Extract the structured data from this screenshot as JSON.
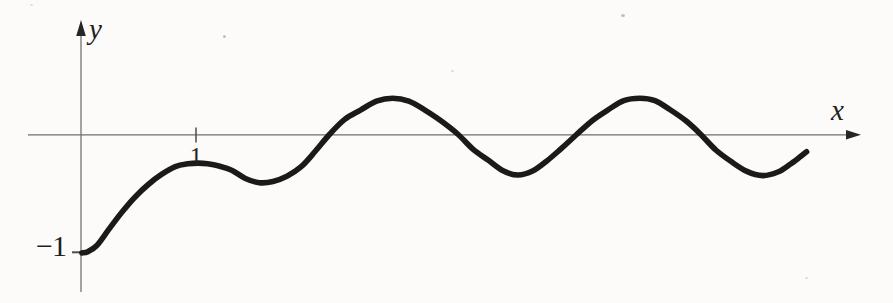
{
  "figure": {
    "width_px": 893,
    "height_px": 303,
    "background": "#fcfbf9",
    "axis_color": "#6e6e6e",
    "tick_color": "#4d4d4d",
    "arrow_color": "#262626",
    "curve_color": "#1a1a1a",
    "text_color": "#1f1f1f",
    "labels": {
      "x_axis": "x",
      "y_axis": "y",
      "x_tick_1": "1",
      "y_tick_neg1": "−1"
    }
  },
  "chart_data": {
    "type": "line",
    "title": "",
    "xlabel": "x",
    "ylabel": "y",
    "grid": false,
    "legend": "none",
    "axes": {
      "x_range_shown": [
        -0.46,
        6.78
      ],
      "y_range_shown": [
        -1.33,
        0.96
      ]
    },
    "x_ticks": [
      {
        "value": 1,
        "label": "1"
      }
    ],
    "y_ticks": [
      {
        "value": -1,
        "label": "−1"
      }
    ],
    "series": [
      {
        "name": "wave-curve",
        "description": "thick smooth curve starting flat at (0,-1), small local max near (1,-0.24), local min near (1.55,-0.41), then oscillating about the x-axis with peaks ~+0.30 at x=2.71 and x=4.86 and troughs ~-0.34 at x=3.80 and x=5.93, ending near (6.31,-0.15)",
        "points": [
          [
            0.008,
            -0.995
          ],
          [
            0.06,
            -0.985
          ],
          [
            0.14,
            -0.93
          ],
          [
            0.24,
            -0.8
          ],
          [
            0.35,
            -0.66
          ],
          [
            0.47,
            -0.525
          ],
          [
            0.585,
            -0.42
          ],
          [
            0.7,
            -0.335
          ],
          [
            0.82,
            -0.27
          ],
          [
            0.93,
            -0.246
          ],
          [
            1.02,
            -0.24
          ],
          [
            1.1,
            -0.246
          ],
          [
            1.2,
            -0.265
          ],
          [
            1.31,
            -0.3
          ],
          [
            1.43,
            -0.37
          ],
          [
            1.55,
            -0.405
          ],
          [
            1.67,
            -0.395
          ],
          [
            1.79,
            -0.35
          ],
          [
            1.91,
            -0.275
          ],
          [
            2.03,
            -0.15
          ],
          [
            2.16,
            0.0
          ],
          [
            2.29,
            0.125
          ],
          [
            2.43,
            0.205
          ],
          [
            2.57,
            0.28
          ],
          [
            2.71,
            0.305
          ],
          [
            2.85,
            0.28
          ],
          [
            2.99,
            0.205
          ],
          [
            3.13,
            0.115
          ],
          [
            3.28,
            0.0
          ],
          [
            3.41,
            -0.125
          ],
          [
            3.54,
            -0.215
          ],
          [
            3.67,
            -0.305
          ],
          [
            3.8,
            -0.34
          ],
          [
            3.93,
            -0.305
          ],
          [
            4.06,
            -0.215
          ],
          [
            4.18,
            -0.115
          ],
          [
            4.31,
            0.0
          ],
          [
            4.45,
            0.12
          ],
          [
            4.58,
            0.205
          ],
          [
            4.72,
            0.285
          ],
          [
            4.86,
            0.305
          ],
          [
            4.99,
            0.285
          ],
          [
            5.12,
            0.21
          ],
          [
            5.26,
            0.115
          ],
          [
            5.39,
            0.0
          ],
          [
            5.52,
            -0.13
          ],
          [
            5.65,
            -0.225
          ],
          [
            5.79,
            -0.31
          ],
          [
            5.93,
            -0.345
          ],
          [
            6.06,
            -0.315
          ],
          [
            6.16,
            -0.255
          ],
          [
            6.25,
            -0.19
          ],
          [
            6.31,
            -0.145
          ]
        ]
      }
    ],
    "layout_px": {
      "origin": {
        "x": 81,
        "y": 134.5
      },
      "unit_px": {
        "x": 115,
        "y": 119
      },
      "x_axis": {
        "x1": 28,
        "x2": 848,
        "arrow_tip_x": 861,
        "y": 134.8
      },
      "y_axis": {
        "y1": 292,
        "y2": 34,
        "arrow_tip_y": 20,
        "x": 81
      },
      "x_tick": {
        "x": 196,
        "y1": 127.5,
        "y2": 142.5
      },
      "y_tick": {
        "x1": 72,
        "x2": 80,
        "y": 252.3
      },
      "curve_stroke_width": 5.6,
      "axis_stroke_width": 1.25,
      "tick_stroke_width": 1.5
    }
  }
}
